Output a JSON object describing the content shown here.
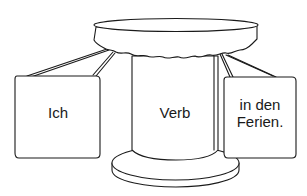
{
  "diagram": {
    "type": "sentence-structure-table",
    "colors": {
      "stroke": "#1a1a1a",
      "fill": "#ffffff"
    },
    "left_card": {
      "text": "Ich"
    },
    "center_column": {
      "text": "Verb"
    },
    "right_card": {
      "line1": "in den",
      "line2": "Ferien."
    }
  }
}
